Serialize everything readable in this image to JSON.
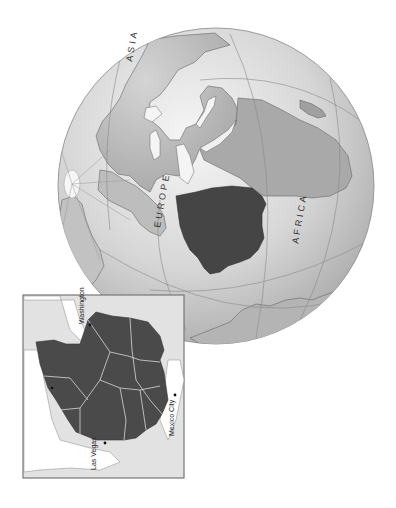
{
  "globe": {
    "labels": {
      "asia": "ASIA",
      "europe": "EUROPE",
      "africa": "AFRICA"
    },
    "colors": {
      "ocean_light": "#f4f4f4",
      "ocean_dark": "#9a9a9a",
      "land": "#c8c8c8",
      "land_mid": "#a8a8a8",
      "highlight": "#444444",
      "graticule": "#8a8a8a",
      "border": "#777777"
    }
  },
  "inset": {
    "cities": {
      "washington": "Washington",
      "las_vegas": "Las Vegas",
      "mexico_city": "Mexico City",
      "unreadable_city": "unreadable"
    },
    "colors": {
      "frame": "#777777",
      "background": "#e2e2e2",
      "water": "#ffffff",
      "highlight": "#4a4a4a",
      "internal_border": "#d8d8d8"
    }
  }
}
